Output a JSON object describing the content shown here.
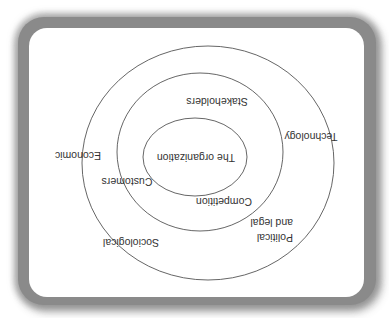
{
  "diagram": {
    "orientation": "rotated 180 degrees",
    "layers": [
      {
        "name": "inner",
        "label": "The organization"
      },
      {
        "name": "middle",
        "labels": [
          "Stakeholders",
          "Customers",
          "Competition"
        ]
      },
      {
        "name": "outer",
        "labels": [
          "Technology",
          "Economic",
          "Sociological",
          "Political and legal"
        ]
      }
    ],
    "labels": {
      "organization": "The organization",
      "stakeholders": "Stakeholders",
      "customers": "Customers",
      "competition": "Competition",
      "technology": "Technology",
      "economic": "Economic",
      "sociological": "Sociological",
      "political_line1": "Political",
      "political_line2": "and legal"
    },
    "colors": {
      "line": "#555555",
      "text": "#333333",
      "frame": "#808080",
      "background": "#ffffff"
    }
  }
}
